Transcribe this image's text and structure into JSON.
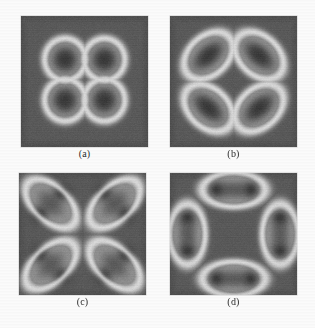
{
  "figure": {
    "background_color": "#fbfbfb",
    "panel_background_color": "#5a5a5a",
    "blob_core_color": "#3a3a3a",
    "ring_color": "#d8d8d8",
    "label_color": "#2b2b2b"
  },
  "panels": [
    {
      "id": "panel-a",
      "label": "(a)",
      "x": 21,
      "y": 16,
      "width": 127,
      "height": 131,
      "label_y": 148,
      "description": "four circular dark blobs in a square arrangement, each encircled by a bright ring",
      "blob_count": 4,
      "ring_count": 4,
      "pattern": "square-four-circular",
      "blobs": [
        {
          "cx": 0.345,
          "cy": 0.33,
          "rx": 0.105,
          "ry": 0.105,
          "angle": 0
        },
        {
          "cx": 0.655,
          "cy": 0.33,
          "rx": 0.105,
          "ry": 0.105,
          "angle": 0
        },
        {
          "cx": 0.345,
          "cy": 0.64,
          "rx": 0.105,
          "ry": 0.105,
          "angle": 0
        },
        {
          "cx": 0.655,
          "cy": 0.64,
          "rx": 0.105,
          "ry": 0.105,
          "angle": 0
        }
      ],
      "rings": [
        {
          "cx": 0.345,
          "cy": 0.33,
          "rx": 0.16,
          "ry": 0.16,
          "angle": 0
        },
        {
          "cx": 0.655,
          "cy": 0.33,
          "rx": 0.16,
          "ry": 0.16,
          "angle": 0
        },
        {
          "cx": 0.345,
          "cy": 0.64,
          "rx": 0.16,
          "ry": 0.16,
          "angle": 0
        },
        {
          "cx": 0.655,
          "cy": 0.64,
          "rx": 0.16,
          "ry": 0.16,
          "angle": 0
        }
      ]
    },
    {
      "id": "panel-b",
      "label": "(b)",
      "x": 170,
      "y": 16,
      "width": 127,
      "height": 131,
      "label_y": 148,
      "description": "four elongated tilted dark blobs in a square arrangement, each encircled by a bright elliptical ring",
      "blob_count": 4,
      "ring_count": 4,
      "pattern": "square-four-elongated",
      "blobs": [
        {
          "cx": 0.3,
          "cy": 0.3,
          "rx": 0.15,
          "ry": 0.075,
          "angle": -40
        },
        {
          "cx": 0.7,
          "cy": 0.3,
          "rx": 0.15,
          "ry": 0.075,
          "angle": 40
        },
        {
          "cx": 0.3,
          "cy": 0.7,
          "rx": 0.15,
          "ry": 0.075,
          "angle": 40
        },
        {
          "cx": 0.7,
          "cy": 0.7,
          "rx": 0.15,
          "ry": 0.075,
          "angle": -40
        }
      ],
      "rings": [
        {
          "cx": 0.3,
          "cy": 0.3,
          "rx": 0.215,
          "ry": 0.15,
          "angle": -40
        },
        {
          "cx": 0.7,
          "cy": 0.3,
          "rx": 0.215,
          "ry": 0.15,
          "angle": 40
        },
        {
          "cx": 0.3,
          "cy": 0.7,
          "rx": 0.215,
          "ry": 0.15,
          "angle": 40
        },
        {
          "cx": 0.7,
          "cy": 0.7,
          "rx": 0.215,
          "ry": 0.15,
          "angle": -40
        }
      ]
    },
    {
      "id": "panel-c",
      "label": "(c)",
      "x": 19,
      "y": 173,
      "width": 127,
      "height": 122,
      "label_y": 296,
      "description": "eight dark blobs arranged as four diagonal pairs forming a ring, each pair wrapped in a bright peanut-shaped contour",
      "blob_count": 8,
      "ring_count": 4,
      "pattern": "ring-eight-paired-diagonal",
      "blobs": [
        {
          "cx": 0.335,
          "cy": 0.16,
          "rx": 0.085,
          "ry": 0.085,
          "angle": 0
        },
        {
          "cx": 0.16,
          "cy": 0.335,
          "rx": 0.085,
          "ry": 0.085,
          "angle": 0
        },
        {
          "cx": 0.665,
          "cy": 0.16,
          "rx": 0.085,
          "ry": 0.085,
          "angle": 0
        },
        {
          "cx": 0.84,
          "cy": 0.335,
          "rx": 0.085,
          "ry": 0.085,
          "angle": 0
        },
        {
          "cx": 0.16,
          "cy": 0.665,
          "rx": 0.085,
          "ry": 0.085,
          "angle": 0
        },
        {
          "cx": 0.335,
          "cy": 0.84,
          "rx": 0.085,
          "ry": 0.085,
          "angle": 0
        },
        {
          "cx": 0.665,
          "cy": 0.84,
          "rx": 0.085,
          "ry": 0.085,
          "angle": 0
        },
        {
          "cx": 0.84,
          "cy": 0.665,
          "rx": 0.085,
          "ry": 0.085,
          "angle": 0
        }
      ],
      "rings": [
        {
          "cx": 0.248,
          "cy": 0.248,
          "rx": 0.245,
          "ry": 0.14,
          "angle": 45
        },
        {
          "cx": 0.752,
          "cy": 0.248,
          "rx": 0.245,
          "ry": 0.14,
          "angle": -45
        },
        {
          "cx": 0.248,
          "cy": 0.752,
          "rx": 0.245,
          "ry": 0.14,
          "angle": -45
        },
        {
          "cx": 0.752,
          "cy": 0.752,
          "rx": 0.245,
          "ry": 0.14,
          "angle": 45
        }
      ]
    },
    {
      "id": "panel-d",
      "label": "(d)",
      "x": 170,
      "y": 173,
      "width": 127,
      "height": 122,
      "label_y": 296,
      "description": "eight dark blobs arranged in an octagonal ring as four axial pairs, each pair wrapped in a bright peanut-shaped contour",
      "blob_count": 8,
      "ring_count": 4,
      "pattern": "ring-eight-paired-axial",
      "blobs": [
        {
          "cx": 0.36,
          "cy": 0.135,
          "rx": 0.085,
          "ry": 0.085,
          "angle": 0
        },
        {
          "cx": 0.64,
          "cy": 0.135,
          "rx": 0.085,
          "ry": 0.085,
          "angle": 0
        },
        {
          "cx": 0.135,
          "cy": 0.36,
          "rx": 0.085,
          "ry": 0.085,
          "angle": 0
        },
        {
          "cx": 0.135,
          "cy": 0.64,
          "rx": 0.085,
          "ry": 0.085,
          "angle": 0
        },
        {
          "cx": 0.865,
          "cy": 0.36,
          "rx": 0.085,
          "ry": 0.085,
          "angle": 0
        },
        {
          "cx": 0.865,
          "cy": 0.64,
          "rx": 0.085,
          "ry": 0.085,
          "angle": 0
        },
        {
          "cx": 0.36,
          "cy": 0.865,
          "rx": 0.085,
          "ry": 0.085,
          "angle": 0
        },
        {
          "cx": 0.64,
          "cy": 0.865,
          "rx": 0.085,
          "ry": 0.085,
          "angle": 0
        }
      ],
      "rings": [
        {
          "cx": 0.5,
          "cy": 0.135,
          "rx": 0.245,
          "ry": 0.14,
          "angle": 0
        },
        {
          "cx": 0.135,
          "cy": 0.5,
          "rx": 0.245,
          "ry": 0.14,
          "angle": 90
        },
        {
          "cx": 0.865,
          "cy": 0.5,
          "rx": 0.245,
          "ry": 0.14,
          "angle": 90
        },
        {
          "cx": 0.5,
          "cy": 0.865,
          "rx": 0.245,
          "ry": 0.14,
          "angle": 0
        }
      ]
    }
  ]
}
